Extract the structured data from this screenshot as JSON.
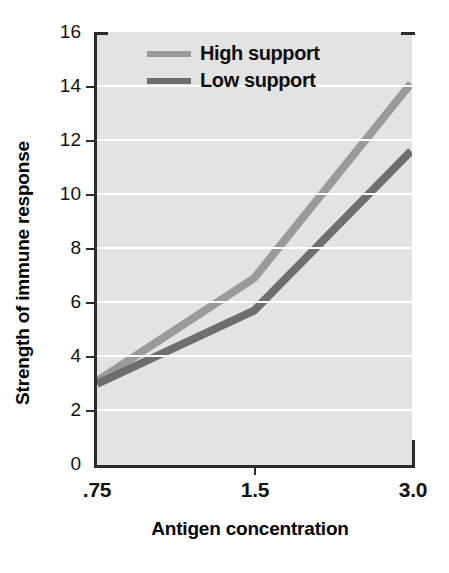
{
  "chart_data": {
    "type": "line",
    "title": "",
    "xlabel": "Antigen concentration",
    "ylabel": "Strength of immune response",
    "categories": [
      ".75",
      "1.5",
      "3.0"
    ],
    "xtick_labels": [
      ".75",
      "1.5",
      "3.0"
    ],
    "ytick_labels": [
      "0",
      "2",
      "4",
      "6",
      "8",
      "10",
      "12",
      "14",
      "16"
    ],
    "ytick_values": [
      0,
      2,
      4,
      6,
      8,
      10,
      12,
      14,
      16
    ],
    "ylim": [
      0,
      16
    ],
    "grid": "horizontal",
    "legend_position": "top-left-inside",
    "series": [
      {
        "name": "High support",
        "values": [
          3.1,
          6.9,
          14.1
        ],
        "color": "#9a9a9a"
      },
      {
        "name": "Low support",
        "values": [
          3.0,
          5.7,
          11.6
        ],
        "color": "#6e6e6e"
      }
    ],
    "plot_background": "#e3e3e3",
    "gridline_color": "#ffffff",
    "axis_color": "#2b2b2b"
  }
}
